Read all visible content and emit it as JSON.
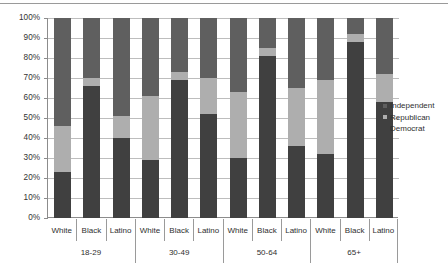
{
  "chart_data": {
    "type": "bar",
    "subtype": "stacked-bar-100-percent",
    "title": "",
    "xlabel": "",
    "ylabel": "",
    "ylim": [
      0,
      100
    ],
    "ytick_labels": [
      "100%",
      "90%",
      "80%",
      "70%",
      "60%",
      "50%",
      "40%",
      "30%",
      "20%",
      "10%",
      "0%"
    ],
    "ytick_values": [
      100,
      90,
      80,
      70,
      60,
      50,
      40,
      30,
      20,
      10,
      0
    ],
    "grid": true,
    "legend_position": "right",
    "stack_order_bottom_to_top": [
      "Democrat",
      "Republican",
      "Independent"
    ],
    "groups": [
      "18-29",
      "30-49",
      "50-64",
      "65+"
    ],
    "categories": [
      "White",
      "Black",
      "Latino",
      "White",
      "Black",
      "Latino",
      "White",
      "Black",
      "Latino",
      "White",
      "Black",
      "Latino"
    ],
    "series": [
      {
        "name": "Democrat",
        "color": "#404040",
        "values": [
          23,
          66,
          40,
          29,
          69,
          52,
          30,
          81,
          36,
          32,
          88,
          58
        ]
      },
      {
        "name": "Republican",
        "color": "#aeaeae",
        "values": [
          23,
          4,
          11,
          32,
          4,
          18,
          33,
          4,
          29,
          37,
          4,
          14
        ]
      },
      {
        "name": "Independent",
        "color": "#5f5f5f",
        "values": [
          54,
          30,
          49,
          39,
          27,
          30,
          37,
          15,
          35,
          31,
          8,
          28
        ]
      }
    ]
  },
  "legend": {
    "items": [
      {
        "label": "Independent",
        "color": "#5f5f5f"
      },
      {
        "label": "Republican",
        "color": "#aeaeae"
      },
      {
        "label": "Democrat",
        "color": "#404040"
      }
    ]
  },
  "axis": {
    "race_labels": [
      "White",
      "Black",
      "Latino",
      "White",
      "Black",
      "Latino",
      "White",
      "Black",
      "Latino",
      "White",
      "Black",
      "Latino"
    ],
    "group_labels": [
      "18-29",
      "30-49",
      "50-64",
      "65+"
    ]
  }
}
